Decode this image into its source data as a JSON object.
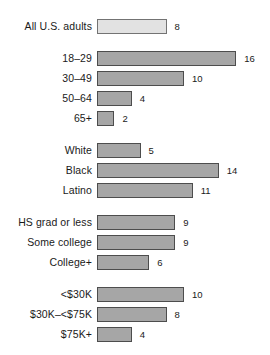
{
  "chart_data": {
    "type": "bar",
    "title": "",
    "subtitle": "",
    "xlabel": "",
    "ylabel": "",
    "orientation": "horizontal",
    "grid": false,
    "legend": null,
    "xlim": [
      0,
      16
    ],
    "unit": "%",
    "px_per_unit": 8.7,
    "colors": {
      "bar_fill": "#a6a6a6",
      "bar_border": "#4d4d4d",
      "highlight_fill": "#e2e2e2",
      "highlight_border": "#737373",
      "text": "#1a1a1a",
      "background": "#ffffff"
    },
    "groups": [
      {
        "name": "total",
        "rows": [
          {
            "label": "All U.S. adults",
            "value": 8,
            "value_text": "8",
            "style": "light"
          }
        ]
      },
      {
        "name": "age",
        "rows": [
          {
            "label": "18–29",
            "value": 16,
            "value_text": "16",
            "style": "normal"
          },
          {
            "label": "30–49",
            "value": 10,
            "value_text": "10",
            "style": "normal"
          },
          {
            "label": "50–64",
            "value": 4,
            "value_text": "4",
            "style": "normal"
          },
          {
            "label": "65+",
            "value": 2,
            "value_text": "2",
            "style": "normal"
          }
        ]
      },
      {
        "name": "race-ethnicity",
        "rows": [
          {
            "label": "White",
            "value": 5,
            "value_text": "5",
            "style": "normal"
          },
          {
            "label": "Black",
            "value": 14,
            "value_text": "14",
            "style": "normal"
          },
          {
            "label": "Latino",
            "value": 11,
            "value_text": "11",
            "style": "normal"
          }
        ]
      },
      {
        "name": "education",
        "rows": [
          {
            "label": "HS grad or less",
            "value": 9,
            "value_text": "9",
            "style": "normal"
          },
          {
            "label": "Some college",
            "value": 9,
            "value_text": "9",
            "style": "normal"
          },
          {
            "label": "College+",
            "value": 6,
            "value_text": "6",
            "style": "normal"
          }
        ]
      },
      {
        "name": "income",
        "rows": [
          {
            "label": "<$30K",
            "value": 10,
            "value_text": "10",
            "style": "normal"
          },
          {
            "label": "$30K–<$75K",
            "value": 8,
            "value_text": "8",
            "style": "normal"
          },
          {
            "label": "$75K+",
            "value": 4,
            "value_text": "4",
            "style": "normal"
          }
        ]
      }
    ]
  }
}
